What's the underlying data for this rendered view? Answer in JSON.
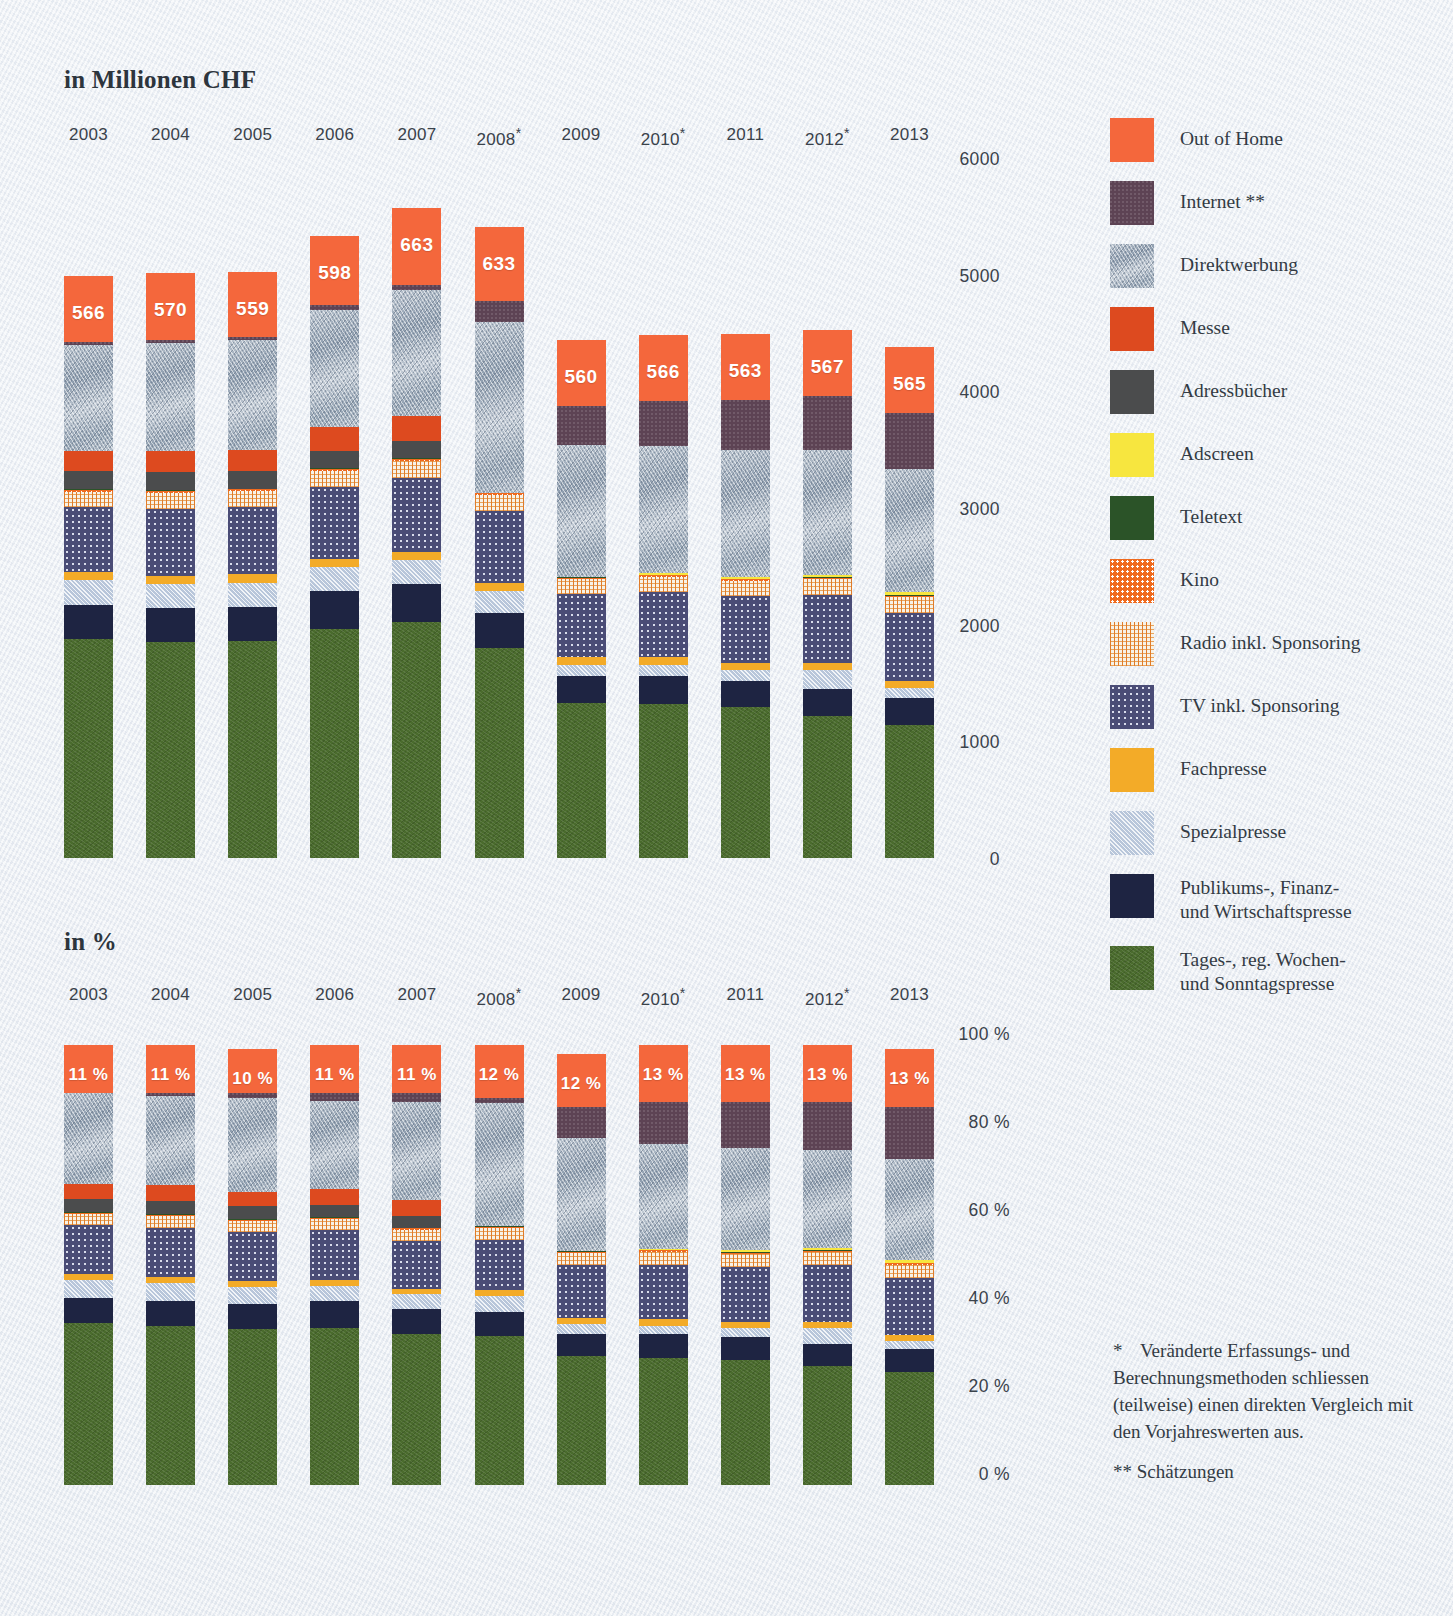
{
  "charts": {
    "top": {
      "title": "in Millionen CHF",
      "ylabel": "",
      "ticks": [
        "6000",
        "5000",
        "4000",
        "3000",
        "2000",
        "1000",
        "0"
      ]
    },
    "bottom": {
      "title": "in %",
      "ticks": [
        "100 %",
        "80 %",
        "60 %",
        "40 %",
        "20 %",
        "0 %"
      ]
    }
  },
  "years": [
    {
      "label": "2003",
      "star": ""
    },
    {
      "label": "2004",
      "star": ""
    },
    {
      "label": "2005",
      "star": ""
    },
    {
      "label": "2006",
      "star": ""
    },
    {
      "label": "2007",
      "star": ""
    },
    {
      "label": "2008",
      "star": "*"
    },
    {
      "label": "2009",
      "star": ""
    },
    {
      "label": "2010",
      "star": "*"
    },
    {
      "label": "2011",
      "star": ""
    },
    {
      "label": "2012",
      "star": "*"
    },
    {
      "label": "2013",
      "star": ""
    }
  ],
  "legend": [
    {
      "name": "Out of Home",
      "key": "ooh",
      "color": "#f4673c"
    },
    {
      "name": "Internet **",
      "key": "net",
      "color": "#5d4354"
    },
    {
      "name": "Direktwerbung",
      "key": "dir",
      "color": "#a3b0bf"
    },
    {
      "name": "Messe",
      "key": "messe",
      "color": "#dd4a1f"
    },
    {
      "name": "Adressbücher",
      "key": "adr",
      "color": "#4b4c4d"
    },
    {
      "name": "Adscreen",
      "key": "ads",
      "color": "#f7e63f"
    },
    {
      "name": "Teletext",
      "key": "tele",
      "color": "#2b5328"
    },
    {
      "name": "Kino",
      "key": "kino",
      "color": "#ef6a1e"
    },
    {
      "name": "Radio inkl. Sponsoring",
      "key": "radio",
      "color": "#f0d3ab"
    },
    {
      "name": "TV inkl. Sponsoring",
      "key": "tv",
      "color": "#4a4c76"
    },
    {
      "name": "Fachpresse",
      "key": "fach",
      "color": "#f3ab28"
    },
    {
      "name": "Spezialpresse",
      "key": "spez",
      "color": "#b8c6da"
    },
    {
      "name": "Publikums-, Finanz-\nund Wirtschaftspresse",
      "key": "pub",
      "color": "#1e2442"
    },
    {
      "name": "Tages-, reg. Wochen-\nund Sonntagspresse",
      "key": "tages",
      "color": "#4a6b2d"
    }
  ],
  "footnote": {
    "star": "*",
    "text1": "Veränderte Erfassungs- und Berechnungsmethoden schliessen (teilweise) einen direkten Vergleich mit den Vorjahreswerten aus.",
    "text2": "** Schätzungen"
  },
  "chart_data": [
    {
      "type": "bar",
      "stacked": true,
      "title": "in Millionen CHF",
      "xlabel": "",
      "ylabel": "in Millionen CHF",
      "ylim": [
        0,
        6000
      ],
      "yticks": [
        0,
        1000,
        2000,
        3000,
        4000,
        5000,
        6000
      ],
      "grid": false,
      "legend_position": "right",
      "categories": [
        "2003",
        "2004",
        "2005",
        "2006",
        "2007",
        "2008*",
        "2009",
        "2010*",
        "2011",
        "2012*",
        "2013"
      ],
      "data_labels": {
        "series": "Out of Home",
        "values": [
          566,
          570,
          559,
          598,
          663,
          633,
          560,
          566,
          563,
          567,
          565
        ]
      },
      "series": [
        {
          "name": "Tages-, reg. Wochen- und Sonntagspresse",
          "key": "tages",
          "values": [
            1880,
            1850,
            1860,
            1960,
            2020,
            1800,
            1330,
            1320,
            1290,
            1220,
            1140
          ]
        },
        {
          "name": "Publikums-, Finanz- und Wirtschaftspresse",
          "key": "pub",
          "values": [
            285,
            290,
            295,
            330,
            330,
            300,
            230,
            240,
            230,
            230,
            230
          ]
        },
        {
          "name": "Spezialpresse",
          "key": "spez",
          "values": [
            215,
            210,
            205,
            200,
            200,
            190,
            95,
            90,
            90,
            160,
            90
          ]
        },
        {
          "name": "Fachpresse",
          "key": "fach",
          "values": [
            70,
            70,
            70,
            70,
            70,
            70,
            70,
            70,
            65,
            65,
            60
          ]
        },
        {
          "name": "TV inkl. Sponsoring",
          "key": "tv",
          "values": [
            560,
            575,
            580,
            620,
            640,
            610,
            540,
            560,
            570,
            580,
            580
          ]
        },
        {
          "name": "Radio inkl. Sponsoring",
          "key": "radio",
          "values": [
            130,
            135,
            135,
            140,
            145,
            140,
            125,
            130,
            130,
            135,
            135
          ]
        },
        {
          "name": "Kino",
          "key": "kino",
          "values": [
            15,
            15,
            15,
            15,
            15,
            15,
            12,
            12,
            12,
            12,
            12
          ]
        },
        {
          "name": "Teletext",
          "key": "tele",
          "values": [
            6,
            6,
            6,
            6,
            6,
            6,
            5,
            5,
            5,
            5,
            5
          ]
        },
        {
          "name": "Adscreen",
          "key": "ads",
          "values": [
            0,
            0,
            0,
            0,
            0,
            0,
            0,
            12,
            18,
            22,
            25
          ]
        },
        {
          "name": "Adressbücher",
          "key": "adr",
          "values": [
            155,
            155,
            155,
            150,
            150,
            0,
            0,
            0,
            0,
            0,
            0
          ]
        },
        {
          "name": "Messe",
          "key": "messe",
          "values": [
            175,
            180,
            175,
            200,
            215,
            0,
            0,
            0,
            0,
            0,
            0
          ]
        },
        {
          "name": "Direktwerbung",
          "key": "dir",
          "values": [
            910,
            930,
            940,
            1010,
            1080,
            1460,
            1130,
            1090,
            1090,
            1070,
            1060
          ]
        },
        {
          "name": "Internet **",
          "key": "net",
          "values": [
            25,
            25,
            30,
            35,
            40,
            185,
            340,
            390,
            430,
            460,
            480
          ]
        },
        {
          "name": "Out of Home",
          "key": "ooh",
          "values": [
            566,
            570,
            559,
            598,
            663,
            633,
            560,
            566,
            563,
            567,
            565
          ]
        }
      ]
    },
    {
      "type": "bar",
      "stacked": true,
      "normalized": true,
      "title": "in %",
      "xlabel": "",
      "ylabel": "in %",
      "ylim": [
        0,
        100
      ],
      "yticks": [
        0,
        20,
        40,
        60,
        80,
        100
      ],
      "grid": false,
      "legend_position": "right",
      "categories": [
        "2003",
        "2004",
        "2005",
        "2006",
        "2007",
        "2008*",
        "2009",
        "2010*",
        "2011",
        "2012*",
        "2013"
      ],
      "data_labels": {
        "series": "Out of Home",
        "values": [
          "11 %",
          "11 %",
          "10 %",
          "11 %",
          "11 %",
          "12 %",
          "12 %",
          "13 %",
          "13 %",
          "13 %",
          "13 %"
        ]
      },
      "series": [
        {
          "name": "Tages-, reg. Wochen- und Sonntagspresse",
          "key": "tages",
          "values": [
            36.8,
            36.1,
            35.5,
            35.7,
            34.4,
            33.8,
            29.3,
            28.9,
            28.5,
            27.0,
            25.6
          ]
        },
        {
          "name": "Publikums-, Finanz- und Wirtschaftspresse",
          "key": "pub",
          "values": [
            5.6,
            5.7,
            5.6,
            6.0,
            5.6,
            5.6,
            5.1,
            5.3,
            5.1,
            5.1,
            5.2
          ]
        },
        {
          "name": "Spezialpresse",
          "key": "spez",
          "values": [
            4.2,
            4.1,
            3.9,
            3.6,
            3.4,
            3.6,
            2.1,
            2.0,
            2.0,
            3.5,
            2.0
          ]
        },
        {
          "name": "Fachpresse",
          "key": "fach",
          "values": [
            1.4,
            1.4,
            1.3,
            1.3,
            1.2,
            1.3,
            1.5,
            1.5,
            1.4,
            1.4,
            1.3
          ]
        },
        {
          "name": "TV inkl. Sponsoring",
          "key": "tv",
          "values": [
            11.0,
            11.2,
            11.1,
            11.3,
            10.9,
            11.4,
            11.9,
            12.4,
            12.6,
            12.9,
            13.0
          ]
        },
        {
          "name": "Radio inkl. Sponsoring",
          "key": "radio",
          "values": [
            2.5,
            2.6,
            2.6,
            2.5,
            2.5,
            2.6,
            2.8,
            2.9,
            2.9,
            3.0,
            3.0
          ]
        },
        {
          "name": "Kino",
          "key": "kino",
          "values": [
            0.3,
            0.3,
            0.3,
            0.3,
            0.3,
            0.3,
            0.3,
            0.3,
            0.3,
            0.3,
            0.3
          ]
        },
        {
          "name": "Teletext",
          "key": "tele",
          "values": [
            0.2,
            0.2,
            0.2,
            0.2,
            0.2,
            0.2,
            0.1,
            0.1,
            0.1,
            0.1,
            0.1
          ]
        },
        {
          "name": "Adscreen",
          "key": "ads",
          "values": [
            0,
            0,
            0,
            0,
            0,
            0,
            0,
            0.3,
            0.4,
            0.5,
            0.6
          ]
        },
        {
          "name": "Adressbücher",
          "key": "adr",
          "values": [
            3.0,
            3.0,
            2.9,
            2.7,
            2.6,
            0,
            0,
            0,
            0,
            0,
            0
          ]
        },
        {
          "name": "Messe",
          "key": "messe",
          "values": [
            3.4,
            3.5,
            3.3,
            3.6,
            3.7,
            0,
            0,
            0,
            0,
            0,
            0
          ]
        },
        {
          "name": "Direktwerbung",
          "key": "dir",
          "values": [
            20.6,
            20.4,
            21.3,
            20.1,
            22.2,
            28.0,
            25.8,
            23.9,
            23.4,
            22.4,
            23.0
          ]
        },
        {
          "name": "Internet **",
          "key": "net",
          "values": [
            0,
            0.5,
            1.0,
            1.7,
            2.0,
            1.2,
            7.1,
            9.4,
            10.3,
            10.8,
            11.9
          ]
        },
        {
          "name": "Out of Home",
          "key": "ooh",
          "values": [
            11,
            11,
            10,
            11,
            11,
            12,
            12,
            13,
            13,
            13,
            13
          ]
        }
      ]
    }
  ]
}
